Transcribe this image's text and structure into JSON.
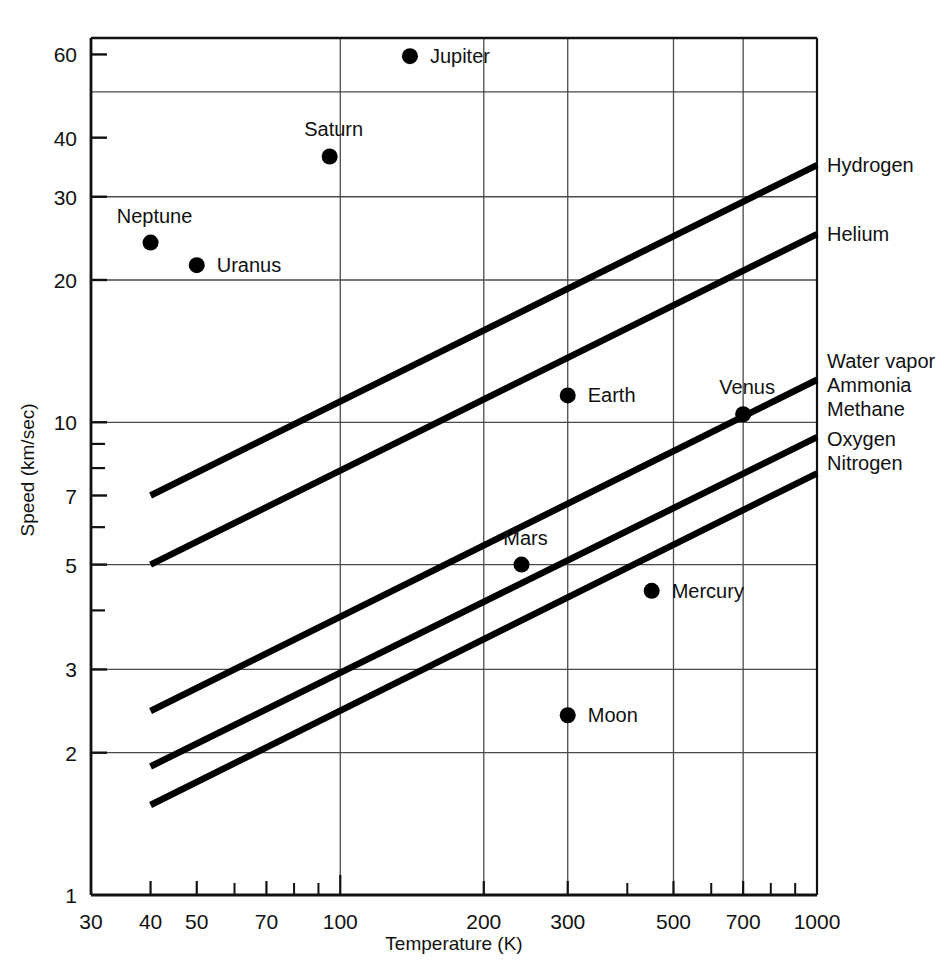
{
  "chart_data": {
    "type": "scatter",
    "title": "",
    "xlabel": "Temperature (K)",
    "ylabel": "Speed (km/sec)",
    "xscale": "log",
    "yscale": "log",
    "xlim": [
      30,
      1000
    ],
    "ylim": [
      1,
      65
    ],
    "grid": true,
    "legend_position": "right-outside",
    "x_ticks_labeled": [
      {
        "value": 30,
        "label": "30"
      },
      {
        "value": 40,
        "label": "40"
      },
      {
        "value": 50,
        "label": "50"
      },
      {
        "value": 70,
        "label": "70"
      },
      {
        "value": 100,
        "label": "100"
      },
      {
        "value": 200,
        "label": "200"
      },
      {
        "value": 300,
        "label": "300"
      },
      {
        "value": 500,
        "label": "500"
      },
      {
        "value": 700,
        "label": "700"
      },
      {
        "value": 1000,
        "label": "1000"
      }
    ],
    "x_ticks_minor": [
      60,
      80,
      90,
      400,
      600,
      800,
      900
    ],
    "x_gridlines": [
      100,
      200,
      300,
      500,
      700
    ],
    "y_ticks_labeled": [
      {
        "value": 60,
        "label": "60"
      },
      {
        "value": 40,
        "label": "40"
      },
      {
        "value": 30,
        "label": "30"
      },
      {
        "value": 20,
        "label": "20"
      },
      {
        "value": 10,
        "label": "10"
      },
      {
        "value": 7,
        "label": "7"
      },
      {
        "value": 5,
        "label": "5"
      },
      {
        "value": 3,
        "label": "3"
      },
      {
        "value": 2,
        "label": "2"
      },
      {
        "value": 1,
        "label": "1"
      }
    ],
    "y_ticks_minor": [
      9,
      8,
      6,
      4
    ],
    "y_gridlines": [
      50,
      30,
      20,
      10,
      5,
      3,
      2
    ],
    "points": [
      {
        "name": "Jupiter",
        "x": 140,
        "y": 59.5,
        "label_side": "right"
      },
      {
        "name": "Saturn",
        "x": 95,
        "y": 36.5,
        "label_side": "above"
      },
      {
        "name": "Neptune",
        "x": 40,
        "y": 24.0,
        "label_side": "above"
      },
      {
        "name": "Uranus",
        "x": 50,
        "y": 21.5,
        "label_side": "right"
      },
      {
        "name": "Earth",
        "x": 300,
        "y": 11.4,
        "label_side": "right"
      },
      {
        "name": "Venus",
        "x": 700,
        "y": 10.4,
        "label_side": "above"
      },
      {
        "name": "Mars",
        "x": 240,
        "y": 5.0,
        "label_side": "above"
      },
      {
        "name": "Mercury",
        "x": 450,
        "y": 4.4,
        "label_side": "right"
      },
      {
        "name": "Moon",
        "x": 300,
        "y": 2.4,
        "label_side": "right"
      }
    ],
    "series": [
      {
        "name": "Hydrogen",
        "label": "Hydrogen",
        "x": [
          40,
          1000
        ],
        "values": [
          7.0,
          35.0
        ]
      },
      {
        "name": "Helium",
        "label": "Helium",
        "x": [
          40,
          1000
        ],
        "values": [
          5.0,
          25.0
        ]
      },
      {
        "name": "HeavyGases",
        "label": "Water vapor\nAmmonia\nMethane",
        "x": [
          40,
          1000
        ],
        "values": [
          2.45,
          12.3
        ]
      },
      {
        "name": "OxygenNitrogen",
        "label": "Oxygen\nNitrogen",
        "x": [
          40,
          1000
        ],
        "values": [
          1.87,
          9.3
        ]
      },
      {
        "name": "Unlabeled",
        "label": "",
        "x": [
          40,
          1000
        ],
        "values": [
          1.55,
          7.8
        ]
      }
    ],
    "right_labels": [
      {
        "text": "Hydrogen"
      },
      {
        "text": "Helium"
      },
      {
        "text": "Water vapor"
      },
      {
        "text": "Ammonia"
      },
      {
        "text": "Methane"
      },
      {
        "text": "Oxygen"
      },
      {
        "text": "Nitrogen"
      }
    ],
    "colors": {
      "ink": "#111111",
      "grid": "#4a4a4a",
      "background": "#ffffff",
      "curve": "#000000"
    }
  }
}
